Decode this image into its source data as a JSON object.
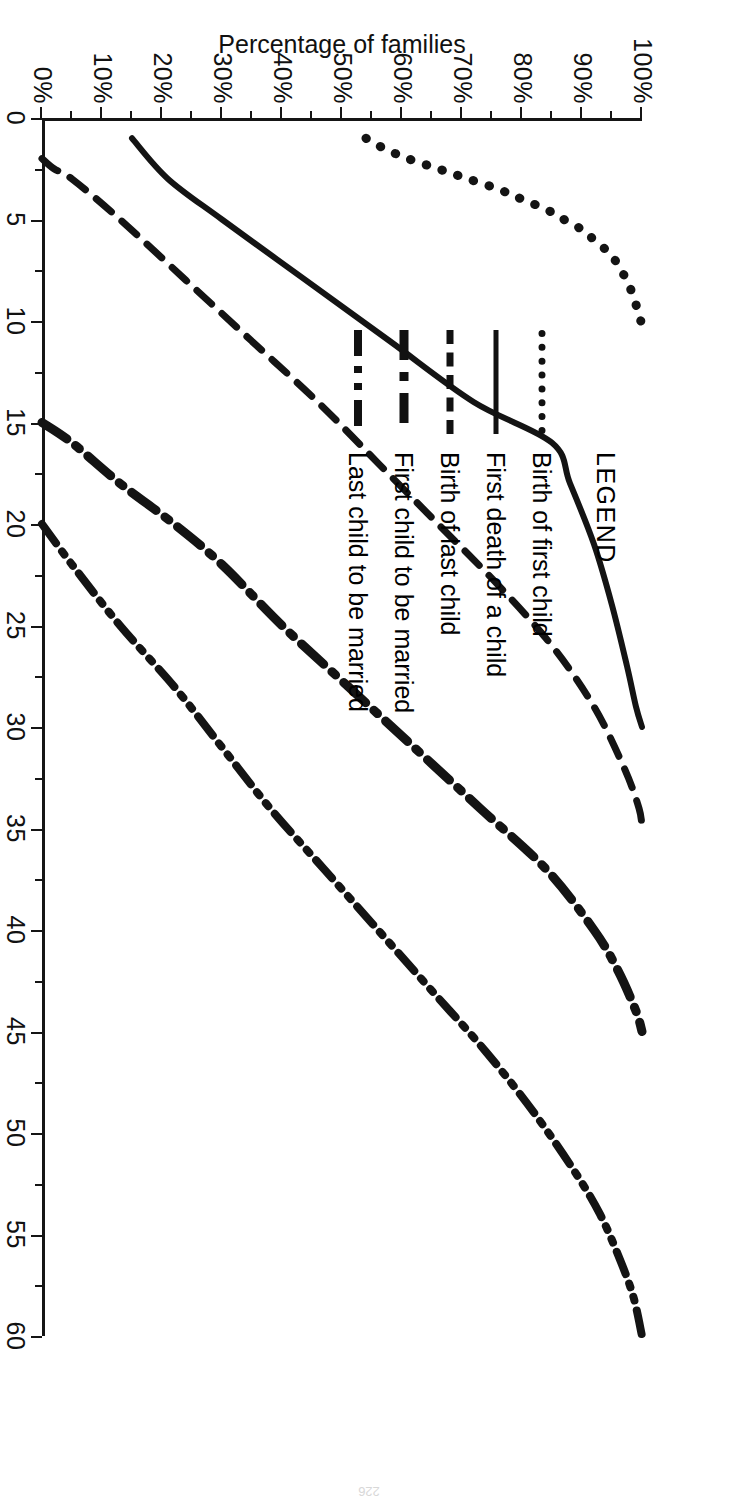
{
  "page_number": "226",
  "legend": {
    "title": "LEGEND",
    "entries": [
      {
        "label": "Birth of first child",
        "style": "dotted",
        "icon": "dotted-line-icon"
      },
      {
        "label": "First death of a child",
        "style": "solid",
        "icon": "solid-line-icon"
      },
      {
        "label": "Birth of last child",
        "style": "dashed",
        "icon": "dashed-line-icon"
      },
      {
        "label": "First child to be married",
        "style": "dashdot",
        "icon": "dash-dot-line-icon"
      },
      {
        "label": "Last child to be married",
        "style": "dashdotdot",
        "icon": "dash-dot-dot-line-icon"
      }
    ]
  },
  "axes": {
    "x_title": "Time elapsed in years since the marriage of the parents",
    "y_title": "Percentage of families",
    "x_ticks": [
      "0",
      "5",
      "10",
      "15",
      "20",
      "25",
      "30",
      "35",
      "40",
      "45",
      "50",
      "55",
      "60"
    ],
    "y_ticks": [
      "0%",
      "10%",
      "20%",
      "30%",
      "40%",
      "50%",
      "60%",
      "70%",
      "80%",
      "90%",
      "100%"
    ]
  },
  "chart_data": {
    "type": "line",
    "title": "",
    "xlabel": "Time elapsed in years since the marriage of the parents",
    "ylabel": "Percentage of families",
    "xlim": [
      0,
      60
    ],
    "ylim": [
      0,
      100
    ],
    "xticks": [
      0,
      5,
      10,
      15,
      20,
      25,
      30,
      35,
      40,
      45,
      50,
      55,
      60
    ],
    "yticks": [
      0,
      10,
      20,
      30,
      40,
      50,
      60,
      70,
      80,
      90,
      100
    ],
    "x_minor_tick_step": 2.5,
    "y_minor_tick_step": 5,
    "grid": false,
    "legend_position": "upper-center",
    "series": [
      {
        "name": "Birth of first child",
        "linestyle": "dotted",
        "x": [
          1,
          1.5,
          2,
          2.5,
          3,
          3.5,
          4,
          4.5,
          5,
          5.5,
          6,
          6.5,
          7,
          7.5,
          8,
          8.5,
          9,
          9.5,
          10
        ],
        "y": [
          54,
          57,
          61,
          66,
          71,
          76,
          80,
          84,
          87,
          90,
          92,
          94,
          95.5,
          96.5,
          97.5,
          98.2,
          98.8,
          99.3,
          99.8
        ]
      },
      {
        "name": "First death of a child",
        "linestyle": "solid",
        "x": [
          1,
          3,
          5,
          8,
          11,
          14,
          16,
          18,
          21,
          24,
          27,
          29,
          30
        ],
        "y": [
          15,
          21,
          30,
          44,
          58,
          72,
          85,
          88,
          92,
          95,
          97.5,
          99,
          100
        ]
      },
      {
        "name": "Birth of last child",
        "linestyle": "dashed",
        "x": [
          2,
          2.5,
          3,
          5,
          8,
          11,
          14,
          17,
          20,
          23,
          26,
          29,
          32,
          34,
          35
        ],
        "y": [
          0,
          2,
          5,
          13,
          24,
          35,
          46,
          56,
          66,
          76,
          85,
          92,
          97,
          99.5,
          100
        ]
      },
      {
        "name": "First child to be married",
        "linestyle": "dashdot",
        "x": [
          15,
          16,
          18,
          20,
          22,
          25,
          28,
          31,
          34,
          37,
          40,
          42,
          44,
          45
        ],
        "y": [
          0,
          5,
          13,
          22,
          30,
          40,
          51,
          62,
          73,
          84,
          92,
          96,
          99,
          100
        ]
      },
      {
        "name": "Last child to be married",
        "linestyle": "dashdotdot",
        "x": [
          20,
          22,
          25,
          28,
          31,
          34,
          37,
          40,
          43,
          46,
          49,
          52,
          54,
          56,
          58,
          60
        ],
        "y": [
          0,
          5,
          13,
          22,
          30,
          38,
          47,
          56,
          65,
          74,
          82,
          89,
          93,
          96,
          98.5,
          100
        ]
      }
    ]
  }
}
